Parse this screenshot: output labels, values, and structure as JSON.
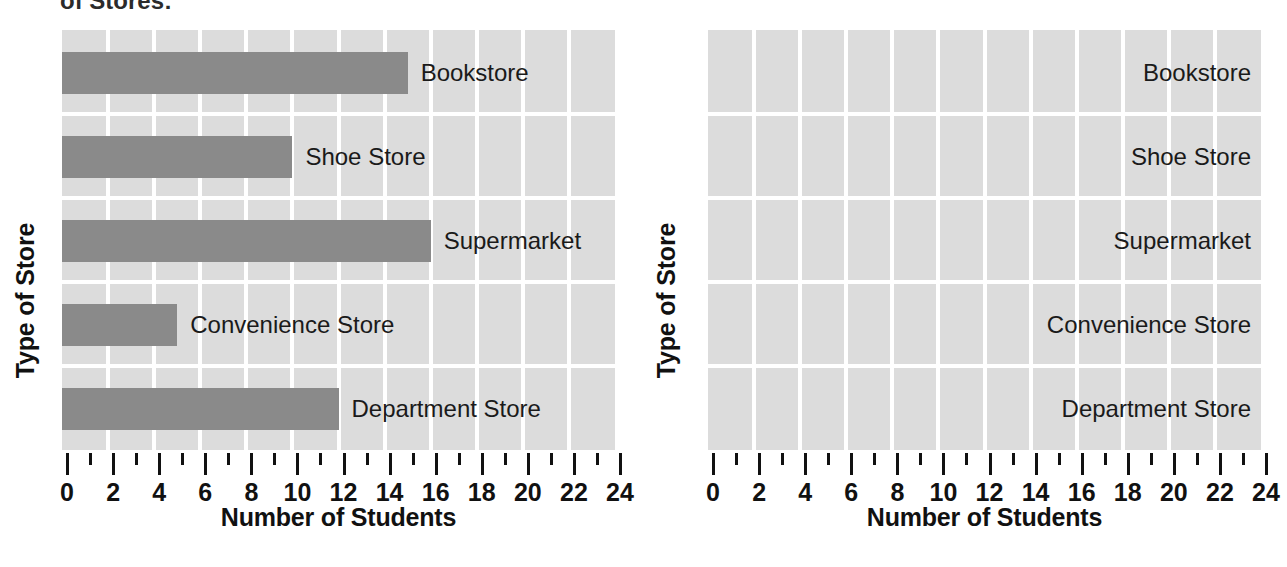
{
  "top_caption": "of Stores:",
  "charts": [
    {
      "id": "left",
      "xlabel": "Number of Students",
      "ylabel": "Type of Store",
      "has_bars": true
    },
    {
      "id": "right",
      "xlabel": "Number of Students",
      "ylabel": "Type of Store",
      "has_bars": false
    }
  ],
  "chart_data": [
    {
      "type": "bar",
      "orientation": "horizontal",
      "title": "",
      "xlabel": "Number of Students",
      "ylabel": "Type of Store",
      "categories": [
        "Bookstore",
        "Shoe Store",
        "Supermarket",
        "Convenience Store",
        "Department Store"
      ],
      "values": [
        15,
        10,
        16,
        5,
        12
      ],
      "xlim": [
        0,
        24
      ],
      "major_ticks": [
        0,
        2,
        4,
        6,
        8,
        10,
        12,
        14,
        16,
        18,
        20,
        22,
        24
      ],
      "minor_ticks": [
        1,
        3,
        5,
        7,
        9,
        11,
        13,
        15,
        17,
        19,
        21,
        23
      ],
      "tick_labels": [
        "0",
        "2",
        "4",
        "6",
        "8",
        "10",
        "12",
        "14",
        "16",
        "18",
        "20",
        "22",
        "24"
      ],
      "grid": true,
      "legend": "none",
      "bar_color": "#8a8a8a",
      "plot_background": "#dcdcdc",
      "gridline_color": "#ffffff"
    },
    {
      "type": "bar",
      "orientation": "horizontal",
      "title": "",
      "xlabel": "Number of Students",
      "ylabel": "Type of Store",
      "categories": [
        "Bookstore",
        "Shoe Store",
        "Supermarket",
        "Convenience Store",
        "Department Store"
      ],
      "values": [
        null,
        null,
        null,
        null,
        null
      ],
      "xlim": [
        0,
        24
      ],
      "major_ticks": [
        0,
        2,
        4,
        6,
        8,
        10,
        12,
        14,
        16,
        18,
        20,
        22,
        24
      ],
      "minor_ticks": [
        1,
        3,
        5,
        7,
        9,
        11,
        13,
        15,
        17,
        19,
        21,
        23
      ],
      "tick_labels": [
        "0",
        "2",
        "4",
        "6",
        "8",
        "10",
        "12",
        "14",
        "16",
        "18",
        "20",
        "22",
        "24"
      ],
      "grid": true,
      "legend": "none",
      "bar_color": "#8a8a8a",
      "plot_background": "#dcdcdc",
      "gridline_color": "#ffffff",
      "note": "blank template grid, no bars drawn"
    }
  ]
}
